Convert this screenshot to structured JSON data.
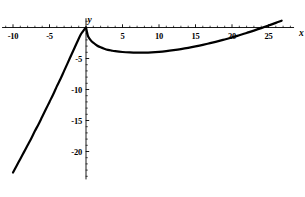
{
  "chart_data": {
    "type": "line",
    "title": "",
    "subtitle": "",
    "xlabel": "x",
    "ylabel": "y",
    "grid": false,
    "legend": null,
    "xlim": [
      -11.5,
      28.5
    ],
    "ylim": [
      -24.5,
      1.5
    ],
    "xticks_major": [
      -10,
      -5,
      5,
      10,
      15,
      20,
      25
    ],
    "xtick_labels": [
      "-10",
      "-5",
      "5",
      "10",
      "15",
      "20",
      "25"
    ],
    "yticks_major": [
      -5,
      -10,
      -15,
      -20
    ],
    "ytick_labels": [
      "-5",
      "-10",
      "-15",
      "-20"
    ],
    "xticks_minor_step": 1,
    "yticks_minor_step": 1,
    "axis_color": "#000000",
    "curve_color": "#000000",
    "curve_width": 2.2,
    "series": [
      {
        "name": "curve-left-branch",
        "x": [
          -10.0,
          -9.5,
          -9.0,
          -8.5,
          -8.0,
          -7.5,
          -7.0,
          -6.5,
          -6.0,
          -5.5,
          -5.0,
          -4.5,
          -4.0,
          -3.5,
          -3.0,
          -2.5,
          -2.0,
          -1.5,
          -1.0,
          -0.7,
          -0.5,
          -0.3,
          -0.15,
          -0.05,
          0.0
        ],
        "y": [
          -23.4,
          -22.3,
          -21.2,
          -20.1,
          -19.0,
          -17.9,
          -16.7,
          -15.6,
          -14.4,
          -13.2,
          -12.0,
          -10.8,
          -9.5,
          -8.3,
          -7.0,
          -5.7,
          -4.4,
          -3.1,
          -1.8,
          -1.1,
          -0.75,
          -0.42,
          -0.2,
          -0.06,
          0.0
        ]
      },
      {
        "name": "curve-right-branch",
        "x": [
          0.0,
          0.25,
          0.5,
          0.75,
          1.0,
          1.5,
          2.0,
          2.5,
          3.0,
          3.5,
          4.0,
          5.0,
          6.0,
          7.0,
          8.0,
          9.0,
          10.0,
          11.0,
          12.0,
          13.0,
          14.0,
          15.0,
          16.0,
          17.0,
          18.0,
          19.0,
          20.0,
          21.0,
          22.0,
          23.0,
          24.0,
          25.0,
          26.0,
          26.8
        ],
        "y": [
          0.0,
          -1.3,
          -1.85,
          -2.2,
          -2.45,
          -2.9,
          -3.2,
          -3.42,
          -3.6,
          -3.72,
          -3.82,
          -3.95,
          -4.02,
          -4.05,
          -4.04,
          -4.0,
          -3.92,
          -3.8,
          -3.65,
          -3.48,
          -3.28,
          -3.05,
          -2.8,
          -2.53,
          -2.24,
          -1.93,
          -1.6,
          -1.25,
          -0.88,
          -0.5,
          -0.1,
          0.32,
          0.75,
          1.1
        ]
      }
    ],
    "annotations": [
      {
        "name": "cusp-point",
        "x": 0,
        "y": 0,
        "note": "cusp at origin"
      },
      {
        "name": "local-minimum",
        "x": 8,
        "y": -4.05,
        "note": "minimum of right branch"
      }
    ]
  },
  "axes": {
    "x_axis_name": "x",
    "y_axis_name": "y"
  },
  "x_tick_labels": [
    {
      "value": -10,
      "text": "-10"
    },
    {
      "value": -5,
      "text": "-5"
    },
    {
      "value": 5,
      "text": "5"
    },
    {
      "value": 10,
      "text": "10"
    },
    {
      "value": 15,
      "text": "15"
    },
    {
      "value": 20,
      "text": "20"
    },
    {
      "value": 25,
      "text": "25"
    }
  ],
  "y_tick_labels": [
    {
      "value": -5,
      "text": "-5"
    },
    {
      "value": -10,
      "text": "-10"
    },
    {
      "value": -15,
      "text": "-15"
    },
    {
      "value": -20,
      "text": "-20"
    }
  ]
}
